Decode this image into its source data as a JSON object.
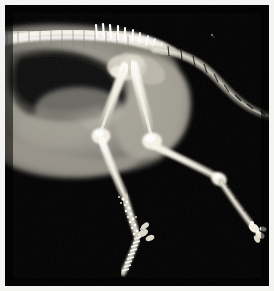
{
  "image": {
    "kind": "radiograph",
    "modality": "X-ray",
    "subject": "bird (avian) lateral view — pelvis, legs and tail",
    "title": "Avian lateral radiograph",
    "background_color": "#000000",
    "border_color": "#f3f3f1",
    "bone_color": "#f2f0e8",
    "soft_tissue_color": "#8e8b82",
    "air_sac_color": "#151515",
    "width": 274,
    "height": 291,
    "plate": {
      "x": 5,
      "y": 5,
      "width": 264,
      "height": 281
    }
  },
  "anatomy": {
    "regions": [
      {
        "name": "vertebral-column",
        "label": "Vertebral column (synsacrum / thoracic spine)",
        "description": "Bright horizontal bony column across the upper third with paired transverse processes"
      },
      {
        "name": "dorsal-spinous-processes",
        "label": "Dorsal spinous processes",
        "description": "Row of thin bright spikes projecting upward from the spine, 10 visible",
        "count": 10
      },
      {
        "name": "body-cavity",
        "label": "Coelomic cavity / air sacs",
        "description": "Large dark radiolucent region in the left half of the plate"
      },
      {
        "name": "soft-tissue-body",
        "label": "Soft tissue body wall",
        "description": "Mid-grey mass surrounding the cavity, ventral border curving downward"
      },
      {
        "name": "tail",
        "label": "Caudal vertebrae (tail)",
        "description": "Segmented chain of vertebrae sweeping from the spine down to the right edge",
        "segments": 14
      },
      {
        "name": "left-femur",
        "label": "Left femur",
        "description": "Long bright bone running down-left from the hip"
      },
      {
        "name": "right-femur",
        "label": "Right femur",
        "description": "Long bright bone running down-right from the hip"
      },
      {
        "name": "left-knee",
        "label": "Left stifle (knee) joint"
      },
      {
        "name": "right-knee",
        "label": "Right stifle (knee) joint"
      },
      {
        "name": "left-tibiotarsus",
        "label": "Left tibiotarsus"
      },
      {
        "name": "right-tibiotarsus",
        "label": "Right tibiotarsus"
      },
      {
        "name": "left-tarsometatarsus",
        "label": "Left tarsometatarsus (mottled, scaled)"
      },
      {
        "name": "right-tarsometatarsus",
        "label": "Right tarsometatarsus"
      },
      {
        "name": "left-foot",
        "label": "Left foot and digits",
        "description": "Lower centre, irregular bright mottled bones with toe phalanges"
      },
      {
        "name": "right-foot",
        "label": "Right foot and digits",
        "description": "Lower right, small bright phalangeal cluster"
      },
      {
        "name": "hip-joint",
        "label": "Acetabulum / hip joint"
      },
      {
        "name": "artifact-speck",
        "label": "Small bright speck artifact",
        "description": "Isolated faint bright dot in the upper-right dark field"
      }
    ]
  }
}
